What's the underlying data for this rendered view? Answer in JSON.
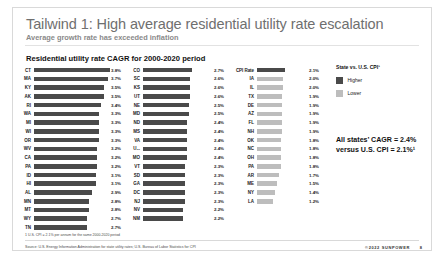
{
  "slide": {
    "title": "Tailwind 1: High average residential utility rate escalation",
    "subtitle": "Average growth rate has exceeded inflation",
    "chart_title": "Residential utility rate CAGR for 2000-2020 period",
    "footnote": "1 U.S. CPI = 2.1% per annum for the same 2000-2020 period",
    "source": "Source: U.S. Energy Information Administration for state utility rates; U.S. Bureau of Labor Statistics for CPI",
    "brand": "©2022 SUNPOWER",
    "page_number": "8"
  },
  "legend": {
    "title": "State vs. U.S. CPI¹",
    "higher_label": "Higher",
    "lower_label": "Lower",
    "higher_color": "#4a4a4a",
    "lower_color": "#bdbdbd"
  },
  "callout": {
    "line1": "All states’ CAGR = 2.4%",
    "line2": "versus U.S. CPI = 2.1%¹"
  },
  "chart_data": {
    "type": "bar",
    "title": "Residential utility rate CAGR for 2000-2020 period",
    "xlabel": "",
    "ylabel": "State",
    "orientation": "horizontal",
    "xlim": [
      0,
      3.8
    ],
    "grid": false,
    "legend_position": "right",
    "threshold": 2.1,
    "threshold_label": "U.S. CPI = 2.1%",
    "columns": [
      {
        "rows": [
          {
            "label": "CT",
            "value": 3.8,
            "display": "3.8%",
            "group": "higher"
          },
          {
            "label": "MA",
            "value": 3.7,
            "display": "3.7%",
            "group": "higher"
          },
          {
            "label": "KY",
            "value": 3.5,
            "display": "3.5%",
            "group": "higher"
          },
          {
            "label": "AK",
            "value": 3.5,
            "display": "3.5%",
            "group": "higher"
          },
          {
            "label": "RI",
            "value": 3.4,
            "display": "3.4%",
            "group": "higher"
          },
          {
            "label": "WA",
            "value": 3.3,
            "display": "3.3%",
            "group": "higher"
          },
          {
            "label": "MI",
            "value": 3.3,
            "display": "3.3%",
            "group": "higher"
          },
          {
            "label": "WI",
            "value": 3.3,
            "display": "3.3%",
            "group": "higher"
          },
          {
            "label": "OR",
            "value": 3.3,
            "display": "3.3%",
            "group": "higher"
          },
          {
            "label": "WV",
            "value": 3.2,
            "display": "3.2%",
            "group": "higher"
          },
          {
            "label": "CA",
            "value": 3.2,
            "display": "3.2%",
            "group": "higher"
          },
          {
            "label": "PA",
            "value": 3.2,
            "display": "3.2%",
            "group": "higher"
          },
          {
            "label": "ID",
            "value": 3.1,
            "display": "3.1%",
            "group": "higher"
          },
          {
            "label": "HI",
            "value": 3.1,
            "display": "3.1%",
            "group": "higher"
          },
          {
            "label": "AL",
            "value": 2.9,
            "display": "2.9%",
            "group": "higher"
          },
          {
            "label": "MN",
            "value": 2.8,
            "display": "2.8%",
            "group": "higher"
          },
          {
            "label": "MT",
            "value": 2.8,
            "display": "2.8%",
            "group": "higher"
          },
          {
            "label": "WY",
            "value": 2.7,
            "display": "2.7%",
            "group": "higher"
          },
          {
            "label": "TN",
            "value": 2.7,
            "display": "2.7%",
            "group": "higher"
          }
        ]
      },
      {
        "rows": [
          {
            "label": "CO",
            "value": 2.7,
            "display": "2.7%",
            "group": "higher"
          },
          {
            "label": "SC",
            "value": 2.6,
            "display": "2.6%",
            "group": "higher"
          },
          {
            "label": "KS",
            "value": 2.6,
            "display": "2.6%",
            "group": "higher"
          },
          {
            "label": "UT",
            "value": 2.6,
            "display": "2.6%",
            "group": "higher"
          },
          {
            "label": "NE",
            "value": 2.5,
            "display": "2.5%",
            "group": "higher"
          },
          {
            "label": "MD",
            "value": 2.5,
            "display": "2.5%",
            "group": "higher"
          },
          {
            "label": "ND",
            "value": 2.4,
            "display": "2.4%",
            "group": "higher"
          },
          {
            "label": "MS",
            "value": 2.4,
            "display": "2.4%",
            "group": "higher"
          },
          {
            "label": "VA",
            "value": 2.4,
            "display": "2.4%",
            "group": "higher"
          },
          {
            "label": "U...",
            "value": 2.4,
            "display": "2.4%",
            "group": "higher"
          },
          {
            "label": "MO",
            "value": 2.4,
            "display": "2.4%",
            "group": "higher"
          },
          {
            "label": "VT",
            "value": 2.3,
            "display": "2.3%",
            "group": "higher"
          },
          {
            "label": "SD",
            "value": 2.3,
            "display": "2.3%",
            "group": "higher"
          },
          {
            "label": "GA",
            "value": 2.3,
            "display": "2.3%",
            "group": "higher"
          },
          {
            "label": "DC",
            "value": 2.3,
            "display": "2.3%",
            "group": "higher"
          },
          {
            "label": "NJ",
            "value": 2.3,
            "display": "2.3%",
            "group": "higher"
          },
          {
            "label": "NV",
            "value": 2.2,
            "display": "2.2%",
            "group": "higher"
          },
          {
            "label": "NM",
            "value": 2.2,
            "display": "2.2%",
            "group": "higher"
          }
        ]
      },
      {
        "rows": [
          {
            "label": "CPI Rate",
            "value": 2.1,
            "display": "2.1%",
            "group": "higher"
          },
          {
            "label": "IA",
            "value": 2.0,
            "display": "2.0%",
            "group": "lower"
          },
          {
            "label": "IL",
            "value": 2.0,
            "display": "2.0%",
            "group": "lower"
          },
          {
            "label": "TX",
            "value": 1.9,
            "display": "1.9%",
            "group": "lower"
          },
          {
            "label": "DE",
            "value": 1.9,
            "display": "1.9%",
            "group": "lower"
          },
          {
            "label": "AZ",
            "value": 1.9,
            "display": "1.9%",
            "group": "lower"
          },
          {
            "label": "FL",
            "value": 1.9,
            "display": "1.9%",
            "group": "lower"
          },
          {
            "label": "NH",
            "value": 1.9,
            "display": "1.9%",
            "group": "lower"
          },
          {
            "label": "OK",
            "value": 1.8,
            "display": "1.8%",
            "group": "lower"
          },
          {
            "label": "NC",
            "value": 1.8,
            "display": "1.8%",
            "group": "lower"
          },
          {
            "label": "OH",
            "value": 1.8,
            "display": "1.8%",
            "group": "lower"
          },
          {
            "label": "PA",
            "value": 1.8,
            "display": "1.8%",
            "group": "lower"
          },
          {
            "label": "AR",
            "value": 1.7,
            "display": "1.7%",
            "group": "lower"
          },
          {
            "label": "ME",
            "value": 1.5,
            "display": "1.5%",
            "group": "lower"
          },
          {
            "label": "NY",
            "value": 1.4,
            "display": "1.4%",
            "group": "lower"
          },
          {
            "label": "LA",
            "value": 1.2,
            "display": "1.2%",
            "group": "lower"
          }
        ]
      }
    ]
  }
}
